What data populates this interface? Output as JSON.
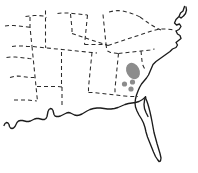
{
  "figure": {
    "background_color": "#ffffff",
    "width": 198,
    "height": 173
  },
  "map": {
    "region_name": "Southeastern United States",
    "coastline": {
      "name": "atlantic-and-gulf-coastline",
      "stroke_color": "#1c1c1c",
      "stroke_width": 1.35,
      "style": "solid",
      "path": "M184.5,6.5 L183.0,11.0 L180.5,13.0 L179.0,16.5 L181.0,18.0 L183.5,16.0 L185.5,13.5 L186.5,10.0 L186.0,7.0 M179.0,16.5 L176.0,19.5 L174.5,23.0 L176.5,25.0 L179.5,24.0 L181.0,26.5 L179.0,29.5 L176.0,31.0 L177.5,34.0 L180.0,35.5 L181.0,38.5 L178.5,40.5 L176.0,42.5 L177.5,45.0 L176.0,47.5 L172.5,49.0 L170.0,51.5 L166.5,54.0 L163.0,56.5 L159.5,59.0 L156.0,61.5 L153.0,64.5 L151.5,68.0 L150.0,71.5 L148.5,75.0 L146.5,78.0 L144.0,81.0 L141.5,84.0 L139.5,87.5 L138.0,91.0 L136.5,95.0 L135.5,99.0 L135.0,103.0 L135.5,107.0 L137.0,111.0 L139.0,115.0 L141.5,119.0 L143.5,123.0 L145.0,127.5 L146.0,132.0 L147.5,137.0 L149.5,142.0 L151.5,147.0 L153.5,152.0 L155.5,156.5 L157.5,159.5 L159.0,161.5 L160.5,161.0 L161.0,158.0 L160.0,153.5 L158.5,148.5 L157.0,143.5 L155.5,138.0 L154.0,132.5 L153.0,127.0 L152.0,121.5 L151.0,116.5 L150.0,112.0 L149.0,108.0 L148.0,104.5 L147.0,101.5 L146.0,99.0 L145.5,97.0",
      "path_gulf": "M145.5,97.0 L142.5,99.5 L139.0,101.5 L135.5,102.5 L132.0,103.0 L128.5,103.5 L125.0,104.5 L121.5,106.0 L118.0,107.5 L114.5,108.5 L111.0,109.0 L107.5,109.0 L104.0,108.5 L100.5,108.0 L97.0,108.0 L93.5,108.5 L90.0,109.5 L87.0,111.0 L84.5,112.5 L82.0,114.0 L79.5,115.0 L77.0,115.5 L74.5,115.0 L72.5,114.0 L70.5,113.0 L68.5,112.5 L66.5,113.0 L64.5,114.0 L62.5,115.0 L60.5,116.0 L58.5,116.5 L56.5,116.5 L55.0,116.0 L54.0,114.5 L53.5,112.5 L53.0,110.5 L52.0,109.0 L50.5,108.5 L49.0,109.5 L48.0,111.5 L47.5,114.0 L47.0,116.5 L46.0,118.5 L44.5,119.5 L42.5,119.5 L40.5,119.0 L38.5,118.5 L36.5,118.5 L34.5,119.0 L32.5,120.0 L30.5,121.0 L28.5,121.5 L26.5,121.5 L24.5,121.0 L22.5,120.5 L20.5,120.5 L18.5,121.0 L17.0,122.5 L16.0,124.5 L15.0,126.5 L13.5,128.0 L12.0,128.5 L10.5,128.0 L9.5,126.5 L9.0,124.5 L8.0,123.0 L6.5,122.5 L5.0,123.5 L4.0,125.5"
    },
    "florida_keys_line": {
      "name": "florida-inner-line",
      "path": "M145.5,97.0 L144.5,100.5 L144.0,104.5 L144.5,108.5 L146.0,112.5 L148.0,116.5"
    },
    "state_borders": [
      {
        "name": "border-segment-1",
        "path": "M25.5,16.5 L29.5,16.0 L34.0,15.5 L38.5,15.5 L43.0,16.0 L46.5,17.5"
      },
      {
        "name": "border-segment-2",
        "path": "M30.0,17.0 L30.0,22.0 L30.0,27.0 L30.5,32.0 L31.0,37.0 L31.5,42.0 L32.0,46.5"
      },
      {
        "name": "border-segment-3",
        "path": "M12.0,46.5 L17.0,46.0 L22.0,46.0 L27.0,46.5 L32.0,46.5 L37.0,47.0 L42.0,47.5 L47.0,48.0 L52.0,48.5 L57.0,49.0 L62.0,49.5 L67.0,50.0 L72.0,50.5 L77.0,51.0 L82.0,51.5 L87.0,52.0 L92.0,52.5 L97.0,53.0"
      },
      {
        "name": "border-segment-4",
        "path": "M32.0,46.5 L32.5,51.5 L33.0,56.5 L33.5,61.5 L34.0,66.5 L34.5,71.5 L35.0,76.5 L35.5,81.5 L36.0,86.5 L36.5,91.5 L37.0,96.5 L37.5,101.0"
      },
      {
        "name": "border-segment-5",
        "path": "M10.0,77.5 L14.0,76.5 L18.0,76.0 L22.0,76.5 L26.0,77.0 L30.0,77.5 L34.5,77.5"
      },
      {
        "name": "border-segment-6",
        "path": "M37.0,86.5 L42.0,86.5 L47.0,86.5 L52.0,86.5 L57.0,86.5 L62.0,87.0"
      },
      {
        "name": "border-segment-7",
        "path": "M62.0,87.0 L62.0,92.0 L62.0,97.0 L62.0,102.0 L62.0,107.0"
      },
      {
        "name": "border-segment-8",
        "path": "M61.5,52.0 L61.5,57.0 L61.5,62.0 L61.5,67.0 L61.5,72.0 L61.5,77.0 L61.5,82.0 L61.5,87.0"
      },
      {
        "name": "border-segment-9",
        "path": "M57.5,13.5 L62.5,13.0 L67.5,13.0 L72.5,13.5 L77.5,14.0 L82.5,14.5 L87.5,15.0"
      },
      {
        "name": "border-segment-10",
        "path": "M87.5,15.0 L87.0,20.0 L86.5,25.0 L86.0,30.0 L85.5,35.0 L85.0,40.0 L84.5,44.5"
      },
      {
        "name": "border-segment-11",
        "path": "M70.5,14.0 L71.0,19.0 L71.5,24.0 L72.0,29.0 L72.0,33.5"
      },
      {
        "name": "border-segment-12",
        "path": "M72.0,33.5 L76.5,35.0 L81.0,36.5 L85.5,38.0 L90.0,39.5 L94.5,41.0 L99.0,42.5 L103.5,44.0 L108.0,45.5"
      },
      {
        "name": "border-segment-13",
        "path": "M108.0,45.5 L112.5,44.0 L117.0,42.5 L121.5,41.0 L126.0,39.5 L130.5,38.0 L135.0,36.5 L139.5,35.0 L144.0,33.5 L148.5,32.0 L153.0,30.5 L157.5,29.5 L162.0,29.0 L166.5,29.0 L171.0,29.5 L175.5,30.5"
      },
      {
        "name": "border-segment-14",
        "path": "M109.0,12.0 L113.5,11.0 L118.0,10.5 L122.5,11.0 L127.0,12.0 L131.5,13.5 L136.0,15.0 L140.0,17.0"
      },
      {
        "name": "border-segment-15",
        "path": "M140.0,17.0 L143.5,19.5 L147.0,22.0 L150.5,24.5 L154.0,26.5 L157.5,28.5 L161.0,30.0"
      },
      {
        "name": "border-segment-16",
        "path": "M103.0,14.5 L103.5,19.5 L104.0,24.5 L104.5,29.5 L105.0,34.5 L105.5,39.5 L106.0,44.0"
      },
      {
        "name": "border-segment-17",
        "path": "M84.5,44.5 L89.0,44.5 L93.5,44.5 L98.0,44.5 L102.5,44.5 L107.0,45.0"
      },
      {
        "name": "border-segment-18",
        "path": "M92.0,52.5 L91.5,57.5 L91.0,62.5 L90.5,67.5 L90.0,72.5 L89.5,77.5 L89.0,82.5 L88.5,87.5 L88.5,92.5"
      },
      {
        "name": "border-segment-19",
        "path": "M88.5,92.5 L93.0,92.5 L97.5,93.0 L102.0,93.5 L106.5,94.0 L111.0,94.5 L115.5,95.0 L120.0,95.5 L124.5,96.0 L129.0,96.5 L133.5,96.5 L138.0,96.5"
      },
      {
        "name": "border-segment-20",
        "path": "M118.5,53.5 L118.0,58.5 L117.5,63.5 L117.0,68.5 L116.5,73.5 L116.0,78.5 L115.5,83.5 L115.0,88.5 L115.0,93.5"
      },
      {
        "name": "border-segment-21",
        "path": "M118.5,53.5 L123.0,53.0 L127.5,52.5 L132.0,52.0 L136.5,51.5 L141.0,51.0 L145.5,50.5 L150.0,50.0 L154.5,49.0"
      },
      {
        "name": "border-segment-22",
        "path": "M106.0,44.0 L106.5,48.0 L107.5,51.0 L110.5,52.5 L114.5,53.0 L118.5,53.5"
      },
      {
        "name": "border-segment-23",
        "path": "M6.5,57.5 L11.0,57.0 L15.5,57.0 L20.0,57.5 L24.5,58.0 L29.0,58.5 L32.8,58.8"
      },
      {
        "name": "border-segment-24",
        "path": "M5.0,26.0 L9.5,25.5 L14.0,25.5 L18.5,26.0 L23.0,26.5 L27.5,27.0 L30.2,27.3"
      },
      {
        "name": "border-segment-25",
        "path": "M45.5,10.5 L45.5,15.5 L45.5,20.5 L45.5,25.5 L45.5,30.5 L45.5,35.5 L45.5,40.5 L45.5,45.5 L45.8,48.0"
      },
      {
        "name": "border-segment-26",
        "path": "M141.0,51.0 L141.5,56.0 L142.0,61.0 L143.0,65.5 L145.0,69.5"
      },
      {
        "name": "border-segment-27",
        "path": "M14.0,100.0 L18.5,100.0 L23.0,100.0 L27.5,100.0 L32.0,100.5 L36.8,101.0"
      }
    ],
    "occurrences": {
      "color": "#8c8c8c",
      "blob": {
        "name": "occurrence-blob-main",
        "description": "filled gray range polygon in northern Georgia / upstate South Carolina",
        "cx": 133,
        "cy": 71,
        "rx": 6.5,
        "ry": 8.5,
        "rotation": -28
      },
      "dots": [
        {
          "name": "occurrence-dot-1",
          "cx": 124.5,
          "cy": 84.0,
          "r": 2.6
        },
        {
          "name": "occurrence-dot-2",
          "cx": 132.5,
          "cy": 82.0,
          "r": 2.6
        },
        {
          "name": "occurrence-dot-3",
          "cx": 131.0,
          "cy": 89.0,
          "r": 2.6
        }
      ]
    }
  }
}
